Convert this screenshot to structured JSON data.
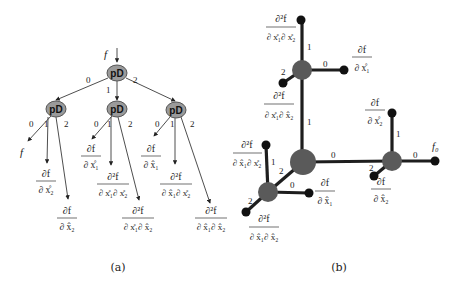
{
  "diagram_a": {
    "caption": "(a)",
    "input_label": "f",
    "node_label": "pD",
    "nodes": [
      {
        "id": "root",
        "label": "pD",
        "x": 117,
        "y": 73
      },
      {
        "id": "child0",
        "label": "pD",
        "x": 56,
        "y": 109
      },
      {
        "id": "child1",
        "label": "pD",
        "x": 117,
        "y": 109
      },
      {
        "id": "child2",
        "label": "pD",
        "x": 176,
        "y": 110
      }
    ],
    "edge_labels": {
      "root": [
        "0",
        "1",
        "2"
      ],
      "child0": [
        "0",
        "1",
        "2"
      ],
      "child1": [
        "0",
        "1",
        "2"
      ],
      "child2": [
        "0",
        "1",
        "2"
      ]
    },
    "leaves": {
      "c0_0": {
        "plain": "f"
      },
      "c0_1": {
        "num": "∂f",
        "den": "∂ x̊₂"
      },
      "c0_2": {
        "num": "∂f",
        "den": "∂ x̂₂"
      },
      "c1_0": {
        "num": "∂f",
        "den": "∂ x̊₁"
      },
      "c1_1": {
        "num": "∂²f",
        "den": "∂ x̊₁∂ x̊₂"
      },
      "c1_2": {
        "num": "∂²f",
        "den": "∂ x̊₁∂ x̂₂"
      },
      "c2_0": {
        "num": "∂f",
        "den": "∂ x̂₁"
      },
      "c2_1": {
        "num": "∂²f",
        "den": "∂ x̂₁∂ x̊₂"
      },
      "c2_2": {
        "num": "∂²f",
        "den": "∂ x̂₁∂ x̂₂"
      }
    }
  },
  "diagram_b": {
    "caption": "(b)",
    "edge_labels": {
      "upper_top": "1",
      "upper_right": "0",
      "upper_left": "2",
      "center_up": "1",
      "center_right": "0",
      "center_left": "2",
      "lower_top": "1",
      "lower_right": "0",
      "lower_left": "2",
      "right_top": "1",
      "right_right": "0",
      "right_left": "2"
    },
    "leaves": {
      "upper_top": {
        "num": "∂²f",
        "den": "∂ x̊₁∂ x̊₂"
      },
      "upper_right": {
        "num": "∂f",
        "den": "∂ x̊₁"
      },
      "upper_left": {
        "num": "∂²f",
        "den": "∂ x̊₁∂ x̂₂"
      },
      "lower_top": {
        "num": "∂²f",
        "den": "∂ x̂₁∂ x̊₂"
      },
      "lower_right": {
        "num": "∂f",
        "den": "∂ x̂₁"
      },
      "lower_left": {
        "num": "∂²f",
        "den": "∂ x̂₁∂ x̂₂"
      },
      "right_top": {
        "num": "∂f",
        "den": "∂ x̊₂"
      },
      "right_right": {
        "plain": "f₀"
      },
      "right_left": {
        "num": "∂f",
        "den": "∂ x̂₂"
      }
    }
  }
}
